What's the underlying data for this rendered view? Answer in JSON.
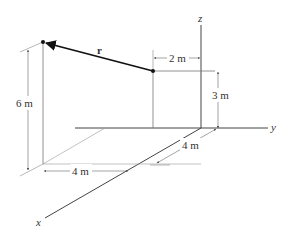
{
  "diagram": {
    "axes": {
      "x_label": "x",
      "y_label": "y",
      "z_label": "z"
    },
    "vector": {
      "label": "r"
    },
    "dimensions": {
      "height_A": "6 m",
      "height_B": "3 m",
      "offset_B": "2 m",
      "x_offset": "4 m",
      "y_offset": "4 m"
    },
    "colors": {
      "line": "#555555",
      "thin": "#888888",
      "vector": "#111111"
    }
  }
}
